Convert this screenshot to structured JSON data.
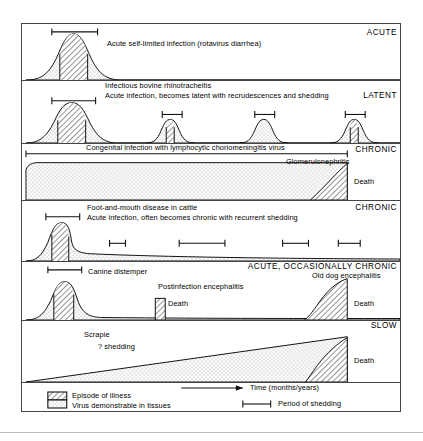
{
  "figure": {
    "title_none": "",
    "panels": [
      {
        "id": "acute",
        "category": "ACUTE",
        "lines": [
          "Acute self-limited infection (rotavirus diarrhea)"
        ],
        "death_labels": [],
        "shedding_bars": 1,
        "peaks": 1
      },
      {
        "id": "latent",
        "category": "LATENT",
        "lines": [
          "Infectious bovine rhinotracheitis",
          "Acute infection, becomes latent with recrudescences and shedding"
        ],
        "death_labels": [],
        "shedding_bars": 4,
        "peaks": 4
      },
      {
        "id": "chronic-lcmv",
        "category": "CHRONIC",
        "lines": [
          "Congenital infection with lymphocytic choriomeningitis virus",
          "Glomerulonephritis"
        ],
        "death_labels": [
          "Death"
        ],
        "shedding_bars": 1,
        "peaks": 0
      },
      {
        "id": "chronic-fmd",
        "category": "CHRONIC",
        "lines": [
          "Foot-and-mouth disease in cattle",
          "Acute infection, often becomes chronic with recurrent shedding"
        ],
        "death_labels": [],
        "shedding_bars": 5,
        "peaks": 1
      },
      {
        "id": "acute-occasionally-chronic",
        "category": "ACUTE, OCCASIONALLY CHRONIC",
        "lines": [
          "Canine distemper",
          "Old dog encephalitis",
          "Postinfection encephalitis"
        ],
        "death_labels": [
          "Death",
          "Death"
        ],
        "shedding_bars": 1,
        "peaks": 1
      },
      {
        "id": "slow",
        "category": "SLOW",
        "lines": [
          "Scrapie",
          "? shedding"
        ],
        "death_labels": [
          "Death"
        ],
        "shedding_bars": 0,
        "peaks": 0
      }
    ],
    "axis": {
      "time_label": "Time (months/years)",
      "arrow": "time-arrow-right"
    },
    "legend": {
      "items": [
        {
          "swatch": "hatched",
          "label": "Episode of illness"
        },
        {
          "swatch": "stippled",
          "label": "Virus demonstrable in tissues"
        }
      ],
      "shedding": {
        "marker": "i-beam",
        "label": "Period of shedding"
      }
    },
    "colors": {
      "ink": "#000000",
      "frame": "#444444",
      "stipple_fill": "#e8e8e8",
      "hatch_fill": "#c9c9c9",
      "background": "#ffffff"
    }
  }
}
